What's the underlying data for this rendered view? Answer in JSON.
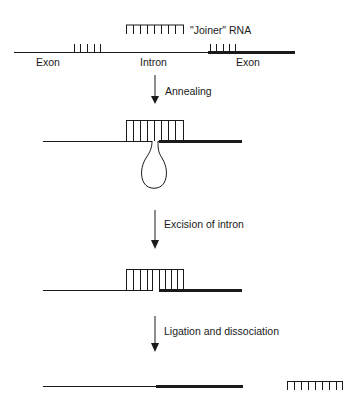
{
  "diagram": {
    "type": "process-flow",
    "colors": {
      "line": "#1a1a1a",
      "background": "#ffffff"
    },
    "stage1": {
      "joiner_label": "\"Joiner\" RNA",
      "labels": {
        "exon_left": "Exon",
        "intron": "Intron",
        "exon_right": "Exon"
      }
    },
    "steps": [
      {
        "label": "Annealing"
      },
      {
        "label": "Excision of intron"
      },
      {
        "label": "Ligation and dissociation"
      }
    ]
  }
}
